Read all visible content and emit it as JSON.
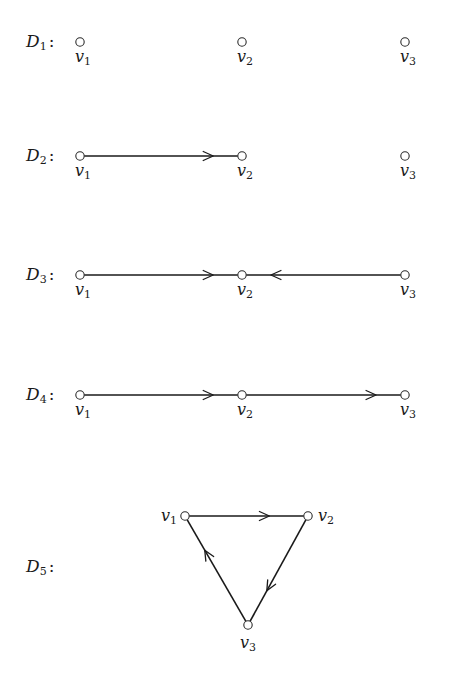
{
  "digraphs": [
    {
      "name": "D",
      "index": "1",
      "separator": ":",
      "layout": "row",
      "vertices": [
        {
          "id": "v1",
          "letter": "v",
          "index": "1"
        },
        {
          "id": "v2",
          "letter": "v",
          "index": "2"
        },
        {
          "id": "v3",
          "letter": "v",
          "index": "3"
        }
      ],
      "arcs": []
    },
    {
      "name": "D",
      "index": "2",
      "separator": ":",
      "layout": "row",
      "vertices": [
        {
          "id": "v1",
          "letter": "v",
          "index": "1"
        },
        {
          "id": "v2",
          "letter": "v",
          "index": "2"
        },
        {
          "id": "v3",
          "letter": "v",
          "index": "3"
        }
      ],
      "arcs": [
        {
          "from": "v1",
          "to": "v2"
        }
      ]
    },
    {
      "name": "D",
      "index": "3",
      "separator": ":",
      "layout": "row",
      "vertices": [
        {
          "id": "v1",
          "letter": "v",
          "index": "1"
        },
        {
          "id": "v2",
          "letter": "v",
          "index": "2"
        },
        {
          "id": "v3",
          "letter": "v",
          "index": "3"
        }
      ],
      "arcs": [
        {
          "from": "v1",
          "to": "v2"
        },
        {
          "from": "v3",
          "to": "v2"
        }
      ]
    },
    {
      "name": "D",
      "index": "4",
      "separator": ":",
      "layout": "row",
      "vertices": [
        {
          "id": "v1",
          "letter": "v",
          "index": "1"
        },
        {
          "id": "v2",
          "letter": "v",
          "index": "2"
        },
        {
          "id": "v3",
          "letter": "v",
          "index": "3"
        }
      ],
      "arcs": [
        {
          "from": "v1",
          "to": "v2"
        },
        {
          "from": "v2",
          "to": "v3"
        }
      ]
    },
    {
      "name": "D",
      "index": "5",
      "separator": ":",
      "layout": "triangle",
      "vertices": [
        {
          "id": "v1",
          "letter": "v",
          "index": "1"
        },
        {
          "id": "v2",
          "letter": "v",
          "index": "2"
        },
        {
          "id": "v3",
          "letter": "v",
          "index": "3"
        }
      ],
      "arcs": [
        {
          "from": "v1",
          "to": "v2"
        },
        {
          "from": "v2",
          "to": "v3"
        },
        {
          "from": "v3",
          "to": "v1"
        }
      ]
    }
  ]
}
